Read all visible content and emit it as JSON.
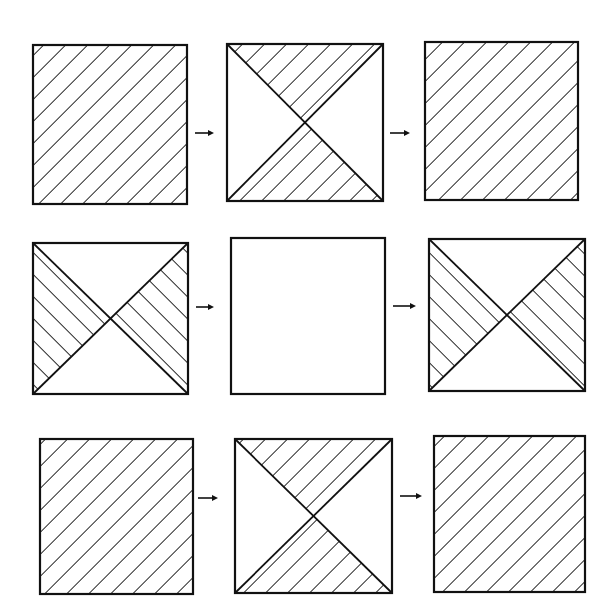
{
  "figure": {
    "description": "3x3 grid of square tiles showing pattern transformations; each row: tile → tile → tile",
    "colors": {
      "background": "#ffffff",
      "ink": "#111111"
    },
    "hatch_spacing_px": 11,
    "rows": [
      {
        "tiles": [
          {
            "x": 33,
            "y": 45,
            "w": 154,
            "h": 159,
            "fill": "full",
            "hatch": "forward-slash"
          },
          {
            "x": 227,
            "y": 44,
            "w": 156,
            "h": 157,
            "fill": "hourglass-top-bottom",
            "hatch": "forward-slash"
          },
          {
            "x": 425,
            "y": 42,
            "w": 153,
            "h": 158,
            "fill": "full",
            "hatch": "forward-slash"
          }
        ],
        "arrows": [
          {
            "x1": 195,
            "x2": 214,
            "y": 133,
            "glyph": "→"
          },
          {
            "x1": 390,
            "x2": 410,
            "y": 133,
            "glyph": "→"
          }
        ]
      },
      {
        "tiles": [
          {
            "x": 33,
            "y": 243,
            "w": 155,
            "h": 151,
            "fill": "bowtie-left-right",
            "hatch": "back-slash"
          },
          {
            "x": 231,
            "y": 238,
            "w": 154,
            "h": 156,
            "fill": "empty",
            "hatch": "none"
          },
          {
            "x": 429,
            "y": 239,
            "w": 156,
            "h": 152,
            "fill": "bowtie-left-right",
            "hatch": "back-slash"
          }
        ],
        "arrows": [
          {
            "x1": 196,
            "x2": 214,
            "y": 307,
            "glyph": "→"
          },
          {
            "x1": 393,
            "x2": 416,
            "y": 306,
            "glyph": "→"
          }
        ]
      },
      {
        "tiles": [
          {
            "x": 40,
            "y": 439,
            "w": 153,
            "h": 155,
            "fill": "full",
            "hatch": "forward-slash"
          },
          {
            "x": 235,
            "y": 439,
            "w": 157,
            "h": 154,
            "fill": "hourglass-top-bottom",
            "hatch": "forward-slash"
          },
          {
            "x": 434,
            "y": 436,
            "w": 151,
            "h": 156,
            "fill": "full",
            "hatch": "forward-slash"
          }
        ],
        "arrows": [
          {
            "x1": 198,
            "x2": 218,
            "y": 498,
            "glyph": "→"
          },
          {
            "x1": 400,
            "x2": 422,
            "y": 496,
            "glyph": "→"
          }
        ]
      }
    ]
  }
}
